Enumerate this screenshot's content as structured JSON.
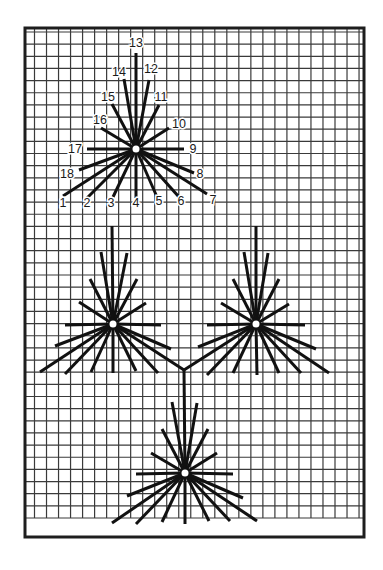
{
  "figure": {
    "colors": {
      "background": "#ffffff",
      "grid": "#3a3a3a",
      "frame": "#1e1e1e",
      "ray": "#111111",
      "hub": "#ffffff"
    },
    "frame": {
      "x": 25,
      "y": 28,
      "width": 339,
      "height": 509
    },
    "grid": {
      "x0": 34.5,
      "x_step": 12.02,
      "x_count": 28,
      "y0": 32,
      "y_step": 12.15,
      "y_count": 41,
      "x_min": 25,
      "x_max": 364,
      "y_min": 28,
      "y_max": 518
    }
  },
  "stars": [
    {
      "id": "labeled-star",
      "center": [
        136,
        149
      ],
      "rays": [
        {
          "n": "1",
          "end": [
            63,
            196
          ],
          "label_pos": [
            63,
            203
          ]
        },
        {
          "n": "2",
          "end": [
            87,
            198
          ],
          "label_pos": [
            87,
            203
          ]
        },
        {
          "n": "3",
          "end": [
            113,
            197
          ],
          "label_pos": [
            111,
            203
          ]
        },
        {
          "n": "4",
          "end": [
            136,
            198
          ],
          "label_pos": [
            136,
            203
          ]
        },
        {
          "n": "5",
          "end": [
            157,
            197
          ],
          "label_pos": [
            159,
            201
          ]
        },
        {
          "n": "6",
          "end": [
            179,
            197
          ],
          "label_pos": [
            181,
            201
          ]
        },
        {
          "n": "7",
          "end": [
            207,
            194
          ],
          "label_pos": [
            213,
            200
          ]
        },
        {
          "n": "8",
          "end": [
            194,
            173
          ],
          "label_pos": [
            200,
            174
          ]
        },
        {
          "n": "9",
          "end": [
            184,
            149
          ],
          "label_pos": [
            193,
            149
          ]
        },
        {
          "n": "10",
          "end": [
            169,
            128
          ],
          "label_pos": [
            179,
            124
          ]
        },
        {
          "n": "11",
          "end": [
            159,
            105
          ],
          "label_pos": [
            161,
            97
          ]
        },
        {
          "n": "12",
          "end": [
            149,
            80
          ],
          "label_pos": [
            151,
            69
          ]
        },
        {
          "n": "13",
          "end": [
            136,
            53
          ],
          "label_pos": [
            136,
            43
          ]
        },
        {
          "n": "14",
          "end": [
            124,
            79
          ],
          "label_pos": [
            119,
            72
          ]
        },
        {
          "n": "15",
          "end": [
            112,
            104
          ],
          "label_pos": [
            108,
            97
          ]
        },
        {
          "n": "16",
          "end": [
            101,
            128
          ],
          "label_pos": [
            100,
            120
          ]
        },
        {
          "n": "17",
          "end": [
            87,
            149
          ],
          "label_pos": [
            75,
            149
          ]
        },
        {
          "n": "18",
          "end": [
            79,
            170
          ],
          "label_pos": [
            67,
            174
          ]
        }
      ]
    },
    {
      "id": "middle-left-star",
      "center": [
        113,
        324
      ],
      "rays": [
        {
          "n": "1",
          "end": [
            40,
            372
          ]
        },
        {
          "n": "2",
          "end": [
            65,
            374
          ]
        },
        {
          "n": "3",
          "end": [
            91,
            372
          ]
        },
        {
          "n": "4",
          "end": [
            113,
            373
          ]
        },
        {
          "n": "5",
          "end": [
            136,
            371
          ]
        },
        {
          "n": "6",
          "end": [
            158,
            373
          ]
        },
        {
          "n": "7",
          "end": [
            184,
            370
          ]
        },
        {
          "n": "8",
          "end": [
            171,
            349
          ]
        },
        {
          "n": "9",
          "end": [
            161,
            325
          ]
        },
        {
          "n": "10",
          "end": [
            146,
            303
          ]
        },
        {
          "n": "11",
          "end": [
            137,
            279
          ]
        },
        {
          "n": "12",
          "end": [
            127,
            253
          ]
        },
        {
          "n": "13",
          "end": [
            112,
            226
          ]
        },
        {
          "n": "14",
          "end": [
            101,
            252
          ]
        },
        {
          "n": "15",
          "end": [
            90,
            279
          ]
        },
        {
          "n": "16",
          "end": [
            79,
            302
          ]
        },
        {
          "n": "17",
          "end": [
            65,
            325
          ]
        },
        {
          "n": "18",
          "end": [
            55,
            346
          ]
        }
      ]
    },
    {
      "id": "middle-right-star",
      "center": [
        256,
        324
      ],
      "rays": [
        {
          "n": "1",
          "end": [
            184,
            370
          ]
        },
        {
          "n": "2",
          "end": [
            207,
            375
          ]
        },
        {
          "n": "3",
          "end": [
            233,
            373
          ]
        },
        {
          "n": "4",
          "end": [
            257,
            375
          ]
        },
        {
          "n": "5",
          "end": [
            279,
            373
          ]
        },
        {
          "n": "6",
          "end": [
            301,
            373
          ]
        },
        {
          "n": "7",
          "end": [
            329,
            373
          ]
        },
        {
          "n": "8",
          "end": [
            316,
            349
          ]
        },
        {
          "n": "9",
          "end": [
            305,
            325
          ]
        },
        {
          "n": "10",
          "end": [
            289,
            304
          ]
        },
        {
          "n": "11",
          "end": [
            279,
            279
          ]
        },
        {
          "n": "12",
          "end": [
            268,
            253
          ]
        },
        {
          "n": "13",
          "end": [
            256,
            226
          ]
        },
        {
          "n": "14",
          "end": [
            244,
            252
          ]
        },
        {
          "n": "15",
          "end": [
            233,
            279
          ]
        },
        {
          "n": "16",
          "end": [
            221,
            303
          ]
        },
        {
          "n": "17",
          "end": [
            207,
            325
          ]
        },
        {
          "n": "18",
          "end": [
            198,
            347
          ]
        }
      ]
    },
    {
      "id": "bottom-star",
      "center": [
        185,
        473
      ],
      "rays": [
        {
          "n": "1",
          "end": [
            112,
            523
          ]
        },
        {
          "n": "2",
          "end": [
            136,
            524
          ]
        },
        {
          "n": "3",
          "end": [
            162,
            522
          ]
        },
        {
          "n": "4",
          "end": [
            185,
            524
          ]
        },
        {
          "n": "5",
          "end": [
            209,
            521
          ]
        },
        {
          "n": "6",
          "end": [
            230,
            521
          ]
        },
        {
          "n": "7",
          "end": [
            257,
            521
          ]
        },
        {
          "n": "8",
          "end": [
            243,
            498
          ]
        },
        {
          "n": "9",
          "end": [
            233,
            474
          ]
        },
        {
          "n": "10",
          "end": [
            217,
            453
          ]
        },
        {
          "n": "11",
          "end": [
            208,
            429
          ]
        },
        {
          "n": "12",
          "end": [
            197,
            403
          ]
        },
        {
          "n": "13",
          "end": [
            184,
            370
          ]
        },
        {
          "n": "14",
          "end": [
            172,
            402
          ]
        },
        {
          "n": "15",
          "end": [
            162,
            429
          ]
        },
        {
          "n": "16",
          "end": [
            151,
            453
          ]
        },
        {
          "n": "17",
          "end": [
            136,
            474
          ]
        },
        {
          "n": "18",
          "end": [
            127,
            496
          ]
        }
      ]
    }
  ],
  "junction": {
    "point": [
      184,
      370
    ],
    "description": "Ray 7 of middle-left star, ray 1 of middle-right star and ray 13 of bottom star meet here"
  }
}
